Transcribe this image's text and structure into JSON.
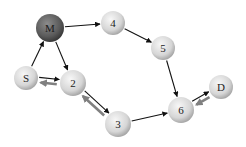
{
  "diagram": {
    "nodes": [
      {
        "id": "M",
        "label": "M",
        "x": 50,
        "y": 28,
        "r": 14,
        "style": "dark"
      },
      {
        "id": "4",
        "label": "4",
        "x": 113,
        "y": 23,
        "r": 12,
        "style": "light"
      },
      {
        "id": "5",
        "label": "5",
        "x": 163,
        "y": 48,
        "r": 12,
        "style": "light"
      },
      {
        "id": "S",
        "label": "S",
        "x": 26,
        "y": 78,
        "r": 12,
        "style": "light"
      },
      {
        "id": "2",
        "label": "2",
        "x": 73,
        "y": 83,
        "r": 13,
        "style": "light"
      },
      {
        "id": "3",
        "label": "3",
        "x": 118,
        "y": 124,
        "r": 13,
        "style": "light"
      },
      {
        "id": "6",
        "label": "6",
        "x": 181,
        "y": 110,
        "r": 13,
        "style": "light"
      },
      {
        "id": "D",
        "label": "D",
        "x": 221,
        "y": 87,
        "r": 12,
        "style": "light"
      }
    ],
    "forward_edges": [
      {
        "from": "S",
        "to": "M"
      },
      {
        "from": "M",
        "to": "4"
      },
      {
        "from": "4",
        "to": "5"
      },
      {
        "from": "5",
        "to": "6"
      },
      {
        "from": "M",
        "to": "2"
      },
      {
        "from": "S",
        "to": "2"
      },
      {
        "from": "2",
        "to": "3"
      },
      {
        "from": "3",
        "to": "6"
      },
      {
        "from": "6",
        "to": "D"
      }
    ],
    "return_edges": [
      {
        "from": "2",
        "to": "S"
      },
      {
        "from": "3",
        "to": "2"
      },
      {
        "from": "D",
        "to": "6"
      }
    ],
    "colors": {
      "forward_edge": "#111111",
      "return_edge": "#808080",
      "node_light_fill": "#d9d9d9",
      "node_light_highlight": "#f7f7f7",
      "node_light_edge": "#a8a8a8",
      "node_dark_fill": "#5a5a5a",
      "node_dark_highlight": "#8c8c8c",
      "node_dark_edge": "#3a3a3a"
    }
  }
}
